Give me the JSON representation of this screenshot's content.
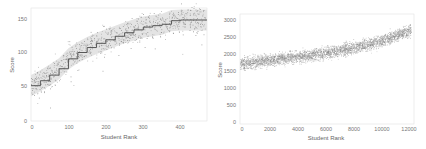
{
  "chart_data": [
    {
      "type": "scatter",
      "title": "",
      "xlabel": "Student Rank",
      "ylabel": "Score",
      "xlim": [
        0,
        470
      ],
      "ylim": [
        0,
        160
      ],
      "xticks": [
        0,
        100,
        200,
        300,
        400
      ],
      "yticks": [
        0,
        50,
        100,
        150
      ],
      "grid": false,
      "legend": null,
      "annotations": "Scatter of individual scores with a dark step-wise mean line and light grey confidence band",
      "series": [
        {
          "name": "mean",
          "x": [
            0,
            25,
            50,
            75,
            100,
            125,
            150,
            175,
            200,
            225,
            250,
            275,
            300,
            325,
            350,
            375,
            400,
            425,
            470
          ],
          "values": [
            50,
            57,
            65,
            74,
            88,
            97,
            104,
            110,
            115,
            120,
            125,
            129,
            133,
            135,
            137,
            142,
            143,
            143,
            143
          ]
        }
      ],
      "band": {
        "lower_offset": -15,
        "upper_offset": 15
      }
    },
    {
      "type": "scatter",
      "title": "",
      "xlabel": "Student Rank",
      "ylabel": "Score",
      "xlim": [
        0,
        12300
      ],
      "ylim": [
        0,
        3100
      ],
      "xticks": [
        0,
        2000,
        4000,
        6000,
        8000,
        10000,
        12000
      ],
      "yticks": [
        0,
        500,
        1000,
        1500,
        2000,
        2500,
        3000
      ],
      "grid": false,
      "legend": null,
      "annotations": "Dense point cloud rising from about 1700 to about 2650",
      "series": [
        {
          "name": "trend",
          "x": [
            0,
            2000,
            4000,
            6000,
            8000,
            10000,
            12000
          ],
          "values": [
            1700,
            1800,
            1900,
            2000,
            2150,
            2350,
            2650
          ]
        }
      ]
    }
  ],
  "left": {
    "xlabel": "Student Rank",
    "ylabel": "Score",
    "xticks": [
      "0",
      "100",
      "200",
      "300",
      "400"
    ],
    "yticks": [
      "0",
      "50",
      "100",
      "150"
    ]
  },
  "right": {
    "xlabel": "Student Rank",
    "ylabel": "Score",
    "xticks": [
      "0",
      "2000",
      "4000",
      "6000",
      "8000",
      "10000",
      "12000"
    ],
    "yticks": [
      "0",
      "500",
      "1000",
      "1500",
      "2000",
      "2500",
      "3000"
    ]
  }
}
